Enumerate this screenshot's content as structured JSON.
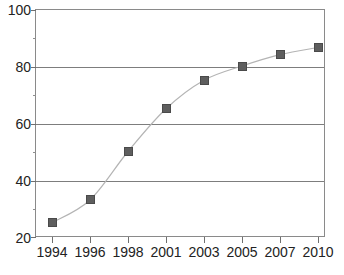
{
  "chart_data": {
    "type": "line",
    "title": "",
    "subtitle": "",
    "xlabel": "",
    "ylabel": "",
    "categories": [
      "1994",
      "1996",
      "1998",
      "2001",
      "2003",
      "2005",
      "2007",
      "2010"
    ],
    "values": [
      25,
      33,
      50,
      65,
      75,
      80,
      84,
      86.5
    ],
    "series": [
      {
        "name": "",
        "values": [
          25,
          33,
          50,
          65,
          75,
          80,
          84,
          86.5
        ]
      }
    ],
    "ylim": [
      20,
      100
    ],
    "ytick_labels": [
      "20",
      "40",
      "60",
      "80",
      "100"
    ],
    "ytick_values": [
      20,
      40,
      60,
      80,
      100
    ],
    "yminor_values": [
      30,
      50,
      70,
      90
    ],
    "grid": "horizontal",
    "legend": "none",
    "marker": "square",
    "marker_color": "#5e5e5e",
    "line_color": "#b4b4b4",
    "axis_color": "#7d7d7d"
  }
}
